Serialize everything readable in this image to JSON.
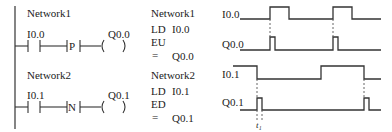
{
  "ladder": {
    "network1": {
      "title": "Network1",
      "contact": "I0.0",
      "edge_box": "P",
      "coil": "Q0.0"
    },
    "network2": {
      "title": "Network2",
      "contact": "I0.1",
      "edge_box": "N",
      "coil": "Q0.1"
    }
  },
  "stl": {
    "network1": {
      "title": "Network1",
      "line1_op": "LD",
      "line1_arg": "I0.0",
      "line2_op": "EU",
      "line3_op": "=",
      "line3_arg": "Q0.0"
    },
    "network2": {
      "title": "Network2",
      "line1_op": "LD",
      "line1_arg": "I0.1",
      "line2_op": "ED",
      "line3_op": "=",
      "line3_arg": "Q0.1"
    }
  },
  "timing": {
    "signals": [
      {
        "label": "I0.0"
      },
      {
        "label": "Q0.0"
      },
      {
        "label": "I0.1"
      },
      {
        "label": "Q0.1"
      }
    ],
    "annotation": "t₁"
  },
  "colors": {
    "line": "#333333",
    "dash": "#555555"
  }
}
